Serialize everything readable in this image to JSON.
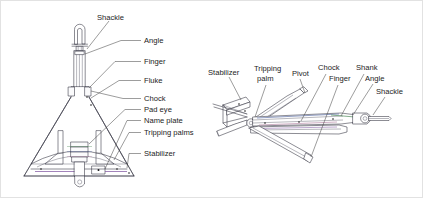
{
  "figure": {
    "background_color": "#ffffff",
    "line_color": "#2e2e3a",
    "text_color": "#1c1c1c",
    "accent_colors": {
      "violet": "#7b4f9e",
      "green": "#4f8b5a",
      "blue": "#4a5f9e",
      "pink": "#b07a9e"
    }
  },
  "left_view": {
    "name": "anchor-front-elevation-view",
    "labels": [
      {
        "id": "shackle",
        "text": "Shackle",
        "x": 96,
        "y": 16
      },
      {
        "id": "angle",
        "text": "Angle",
        "x": 143,
        "y": 42
      },
      {
        "id": "finger",
        "text": "Finger",
        "x": 143,
        "y": 63
      },
      {
        "id": "fluke",
        "text": "Fluke",
        "x": 143,
        "y": 82
      },
      {
        "id": "chock",
        "text": "Chock",
        "x": 143,
        "y": 100
      },
      {
        "id": "pad-eye",
        "text": "Pad eye",
        "x": 143,
        "y": 111
      },
      {
        "id": "name-plate",
        "text": "Name plate",
        "x": 143,
        "y": 122
      },
      {
        "id": "tripping-palms",
        "text": "Tripping palms",
        "x": 143,
        "y": 134
      },
      {
        "id": "stabilizer",
        "text": "Stabilizer",
        "x": 143,
        "y": 155
      }
    ]
  },
  "right_view": {
    "name": "anchor-perspective-view",
    "labels": [
      {
        "id": "stabilizer",
        "text": "Stabilizer",
        "x": 207,
        "y": 72
      },
      {
        "id": "tripping",
        "text": "Tripping",
        "x": 253,
        "y": 70
      },
      {
        "id": "palm",
        "text": "palm",
        "x": 256,
        "y": 80
      },
      {
        "id": "pivot",
        "text": "Pivot",
        "x": 291,
        "y": 73
      },
      {
        "id": "chock",
        "text": "Chock",
        "x": 317,
        "y": 68
      },
      {
        "id": "shank",
        "text": "Shank",
        "x": 355,
        "y": 68
      },
      {
        "id": "finger",
        "text": "Finger",
        "x": 328,
        "y": 80
      },
      {
        "id": "angle",
        "text": "Angle",
        "x": 364,
        "y": 79
      },
      {
        "id": "shackle",
        "text": "Shackle",
        "x": 375,
        "y": 92
      }
    ]
  }
}
